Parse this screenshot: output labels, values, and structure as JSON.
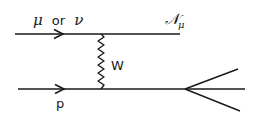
{
  "diagram": {
    "type": "feynman-diagram",
    "colors": {
      "line": "#1a1a1a",
      "background": "#ffffff"
    },
    "labels": {
      "incoming_lepton": {
        "mu": "μ",
        "or": "or",
        "nu": "ν"
      },
      "outgoing_lepton": {
        "main": "𝒩",
        "subscript": "μ"
      },
      "boson": "W",
      "incoming_hadron": "p"
    },
    "lines": [
      {
        "id": "lepton-line",
        "from": [
          15,
          34
        ],
        "to": [
          180,
          34
        ],
        "arrow_at": 62
      },
      {
        "id": "hadron-line",
        "from": [
          18,
          89
        ],
        "to": [
          185,
          89
        ],
        "arrow_at": 62
      },
      {
        "id": "w-propagator",
        "from": [
          101,
          34
        ],
        "to": [
          101,
          89
        ],
        "style": "wavy"
      },
      {
        "id": "jet-upper",
        "from": [
          185,
          89
        ],
        "to": [
          238,
          69
        ]
      },
      {
        "id": "jet-middle",
        "from": [
          185,
          89
        ],
        "to": [
          245,
          89
        ]
      },
      {
        "id": "jet-lower",
        "from": [
          185,
          89
        ],
        "to": [
          240,
          111
        ]
      }
    ]
  }
}
